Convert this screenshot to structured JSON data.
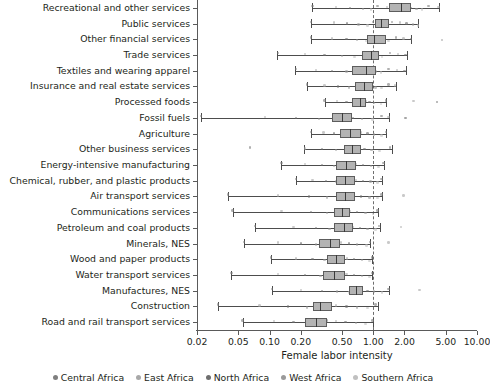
{
  "chart_data": {
    "type": "boxplot",
    "title": "",
    "xlabel": "Female labor intensity",
    "ylabel": "",
    "xscale": "log",
    "xlim": [
      0.02,
      10.0
    ],
    "xticks": [
      0.02,
      0.05,
      0.1,
      0.2,
      0.5,
      1.0,
      2.0,
      5.0,
      10.0
    ],
    "xticklabels": [
      "0.02",
      "0.05",
      "0.10",
      "0.20",
      "0.50",
      "1.00",
      "2.00",
      "5.00",
      "10.00"
    ],
    "grid": false,
    "reference_line": {
      "value": 1.0,
      "style": "dashed",
      "color": "#6e6e6e"
    },
    "legend_position": "bottom",
    "legend": [
      {
        "name": "Central Africa",
        "color": "#7f7f7f"
      },
      {
        "name": "East Africa",
        "color": "#a8a8a8"
      },
      {
        "name": "North Africa",
        "color": "#6e6e6e"
      },
      {
        "name": "West Africa",
        "color": "#9a9a9a"
      },
      {
        "name": "Southern Africa",
        "color": "#c0c0c0"
      }
    ],
    "categories": [
      "Recreational and other services",
      "Public services",
      "Other financial services",
      "Trade services",
      "Textiles and wearing apparel",
      "Insurance and real estate services",
      "Processed foods",
      "Fossil fuels",
      "Agriculture",
      "Other business services",
      "Energy-intensive manufacturing",
      "Chemical, rubber, and plastic products",
      "Air transport services",
      "Communications services",
      "Petroleum and coal products",
      "Minerals, NES",
      "Wood and paper products",
      "Water transport services",
      "Manufactures, NES",
      "Construction",
      "Road and rail transport services"
    ],
    "boxes": [
      {
        "category": "Recreational and other services",
        "whisker_low": 0.255,
        "q1": 1.42,
        "median": 1.86,
        "q3": 2.3,
        "whisker_high": 4.3,
        "points": [
          0.26,
          0.44,
          0.6,
          0.8,
          0.95,
          1.1,
          1.35,
          1.55,
          1.72,
          1.88,
          2.0,
          2.15,
          2.32,
          2.6,
          2.95,
          3.4,
          4.25
        ]
      },
      {
        "category": "Public services",
        "whisker_low": 0.25,
        "q1": 1.03,
        "median": 1.18,
        "q3": 1.42,
        "whisker_high": 2.72,
        "points": [
          0.25,
          0.42,
          0.56,
          0.72,
          0.88,
          1.0,
          1.08,
          1.18,
          1.28,
          1.38,
          1.52,
          1.8,
          2.1,
          2.4,
          2.7
        ]
      },
      {
        "category": "Other financial services",
        "whisker_low": 0.25,
        "q1": 0.88,
        "median": 1.02,
        "q3": 1.33,
        "whisker_high": 2.32,
        "points": [
          0.25,
          0.4,
          0.55,
          0.7,
          0.85,
          0.95,
          1.02,
          1.12,
          1.25,
          1.4,
          1.65,
          1.95,
          2.3,
          4.6
        ]
      },
      {
        "category": "Trade services",
        "whisker_low": 0.118,
        "q1": 0.78,
        "median": 0.96,
        "q3": 1.14,
        "whisker_high": 2.1,
        "points": [
          0.12,
          0.22,
          0.34,
          0.5,
          0.66,
          0.8,
          0.92,
          1.0,
          1.1,
          1.22,
          1.45,
          1.72,
          2.05
        ]
      },
      {
        "category": "Textiles and wearing apparel",
        "whisker_low": 0.175,
        "q1": 0.62,
        "median": 0.86,
        "q3": 1.06,
        "whisker_high": 2.05,
        "points": [
          0.18,
          0.28,
          0.4,
          0.55,
          0.68,
          0.8,
          0.9,
          0.98,
          1.05,
          1.18,
          1.4,
          1.7,
          2.0
        ]
      },
      {
        "category": "Insurance and real estate services",
        "whisker_low": 0.23,
        "q1": 0.66,
        "median": 0.81,
        "q3": 0.99,
        "whisker_high": 1.66,
        "points": [
          0.23,
          0.34,
          0.46,
          0.58,
          0.7,
          0.8,
          0.88,
          0.96,
          1.05,
          1.2,
          1.4,
          1.62
        ]
      },
      {
        "category": "Processed foods",
        "whisker_low": 0.34,
        "q1": 0.62,
        "median": 0.74,
        "q3": 0.86,
        "whisker_high": 1.34,
        "points": [
          0.34,
          0.45,
          0.55,
          0.64,
          0.72,
          0.78,
          0.84,
          0.92,
          1.02,
          1.18,
          1.32,
          2.45,
          4.1
        ]
      },
      {
        "category": "Fossil fuels",
        "whisker_low": 0.022,
        "q1": 0.4,
        "median": 0.5,
        "q3": 0.62,
        "whisker_high": 1.42,
        "points": [
          0.022,
          0.09,
          0.18,
          0.3,
          0.42,
          0.5,
          0.56,
          0.64,
          0.78,
          0.98,
          1.2,
          1.4,
          2.05
        ]
      },
      {
        "category": "Agriculture",
        "whisker_low": 0.25,
        "q1": 0.48,
        "median": 0.6,
        "q3": 0.76,
        "whisker_high": 1.34,
        "points": [
          0.25,
          0.33,
          0.42,
          0.52,
          0.6,
          0.68,
          0.76,
          0.88,
          1.02,
          1.2,
          1.32
        ]
      },
      {
        "category": "Other business services",
        "whisker_low": 0.215,
        "q1": 0.52,
        "median": 0.62,
        "q3": 0.76,
        "whisker_high": 1.5,
        "points": [
          0.065,
          0.22,
          0.32,
          0.44,
          0.55,
          0.63,
          0.72,
          0.82,
          0.96,
          1.15,
          1.45
        ]
      },
      {
        "category": "Energy-intensive manufacturing",
        "whisker_low": 0.13,
        "q1": 0.44,
        "median": 0.55,
        "q3": 0.68,
        "whisker_high": 1.28,
        "points": [
          0.13,
          0.22,
          0.32,
          0.42,
          0.52,
          0.6,
          0.68,
          0.8,
          0.95,
          1.12,
          1.26
        ]
      },
      {
        "category": "Chemical, rubber, and plastic products",
        "whisker_low": 0.18,
        "q1": 0.44,
        "median": 0.54,
        "q3": 0.66,
        "whisker_high": 1.22,
        "points": [
          0.18,
          0.26,
          0.35,
          0.44,
          0.52,
          0.6,
          0.68,
          0.8,
          0.94,
          1.1,
          1.2
        ]
      },
      {
        "category": "Air transport services",
        "whisker_low": 0.04,
        "q1": 0.44,
        "median": 0.54,
        "q3": 0.66,
        "whisker_high": 1.22,
        "points": [
          0.04,
          0.12,
          0.24,
          0.36,
          0.47,
          0.56,
          0.64,
          0.76,
          0.92,
          1.1,
          1.2,
          1.95
        ]
      },
      {
        "category": "Communications services",
        "whisker_low": 0.044,
        "q1": 0.42,
        "median": 0.5,
        "q3": 0.6,
        "whisker_high": 1.12,
        "points": [
          0.044,
          0.13,
          0.25,
          0.36,
          0.45,
          0.52,
          0.6,
          0.7,
          0.84,
          1.0,
          1.1
        ]
      },
      {
        "category": "Petroleum and coal products",
        "whisker_low": 0.072,
        "q1": 0.42,
        "median": 0.52,
        "q3": 0.64,
        "whisker_high": 1.16,
        "points": [
          0.072,
          0.17,
          0.28,
          0.38,
          0.47,
          0.55,
          0.63,
          0.74,
          0.88,
          1.05,
          1.14,
          1.85
        ]
      },
      {
        "category": "Minerals, NES",
        "whisker_low": 0.057,
        "q1": 0.3,
        "median": 0.38,
        "q3": 0.48,
        "whisker_high": 0.94,
        "points": [
          0.057,
          0.12,
          0.2,
          0.28,
          0.35,
          0.42,
          0.49,
          0.58,
          0.7,
          0.86,
          0.93,
          1.4
        ]
      },
      {
        "category": "Wood and paper products",
        "whisker_low": 0.103,
        "q1": 0.36,
        "median": 0.44,
        "q3": 0.54,
        "whisker_high": 0.98,
        "points": [
          0.103,
          0.18,
          0.26,
          0.34,
          0.42,
          0.48,
          0.56,
          0.65,
          0.78,
          0.92,
          0.97
        ]
      },
      {
        "category": "Water transport services",
        "whisker_low": 0.043,
        "q1": 0.33,
        "median": 0.42,
        "q3": 0.53,
        "whisker_high": 0.98,
        "points": [
          0.043,
          0.12,
          0.22,
          0.31,
          0.4,
          0.47,
          0.55,
          0.65,
          0.78,
          0.92,
          0.97
        ]
      },
      {
        "category": "Manufactures, NES",
        "whisker_low": 0.105,
        "q1": 0.58,
        "median": 0.68,
        "q3": 0.8,
        "whisker_high": 1.42,
        "points": [
          0.105,
          0.2,
          0.32,
          0.45,
          0.58,
          0.68,
          0.76,
          0.88,
          1.02,
          1.22,
          1.4,
          2.8
        ]
      },
      {
        "category": "Construction",
        "whisker_low": 0.032,
        "q1": 0.26,
        "median": 0.31,
        "q3": 0.4,
        "whisker_high": 1.1,
        "points": [
          0.032,
          0.08,
          0.15,
          0.23,
          0.3,
          0.36,
          0.44,
          0.55,
          0.7,
          0.88,
          1.05
        ]
      },
      {
        "category": "Road and rail transport services",
        "whisker_low": 0.055,
        "q1": 0.22,
        "median": 0.28,
        "q3": 0.36,
        "whisker_high": 1.0,
        "points": [
          0.055,
          0.11,
          0.17,
          0.24,
          0.3,
          0.36,
          0.44,
          0.54,
          0.68,
          0.84,
          0.98
        ]
      }
    ]
  },
  "axis": {
    "x_title": "Female labor intensity"
  }
}
